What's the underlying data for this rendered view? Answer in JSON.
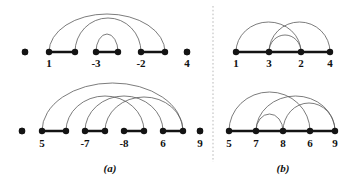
{
  "figure": {
    "type": "arc-diagram-figure",
    "background": "#ffffff",
    "node_color": "#141414",
    "segment_color": "#141414",
    "arc_color": "#5a5a5a",
    "divider_color": "#b9b9b9",
    "panels": [
      {
        "id": "a",
        "caption": "(a)",
        "caption_x": 110,
        "caption_y": 172,
        "rows": [
          {
            "id": "a-top",
            "baseline_y": 52,
            "nodes": [
              {
                "label": "",
                "x": 25,
                "show_label": false
              },
              {
                "label": "1",
                "x": 49,
                "show_label": true,
                "label_x": 49
              },
              {
                "label": "",
                "x": 75,
                "show_label": false
              },
              {
                "label": "-3",
                "x": 96,
                "show_label": true,
                "label_x": 96
              },
              {
                "label": "",
                "x": 118,
                "show_label": false
              },
              {
                "label": "-2",
                "x": 141,
                "show_label": true,
                "label_x": 141
              },
              {
                "label": "",
                "x": 165,
                "show_label": false
              },
              {
                "label": "4",
                "x": 187,
                "show_label": true,
                "label_x": 187
              }
            ],
            "label_y": 67,
            "segments": [
              {
                "x1": 49,
                "x2": 75
              },
              {
                "x1": 96,
                "x2": 118
              },
              {
                "x1": 141,
                "x2": 165
              }
            ],
            "arcs": [
              {
                "x1": 49,
                "x2": 165,
                "height": 38
              },
              {
                "x1": 75,
                "x2": 141,
                "height": 34
              },
              {
                "x1": 96,
                "x2": 118,
                "height": 18
              }
            ],
            "isolated": [
              {
                "x": 25
              },
              {
                "x": 187
              }
            ]
          },
          {
            "id": "a-bottom",
            "baseline_y": 131,
            "nodes": [
              {
                "label": "",
                "x": 22,
                "show_label": false
              },
              {
                "label": "5",
                "x": 42,
                "show_label": true,
                "label_x": 42
              },
              {
                "label": "",
                "x": 66,
                "show_label": false
              },
              {
                "label": "-7",
                "x": 85,
                "show_label": true,
                "label_x": 85
              },
              {
                "label": "",
                "x": 105,
                "show_label": false
              },
              {
                "label": "-8",
                "x": 124,
                "show_label": true,
                "label_x": 124
              },
              {
                "label": "",
                "x": 144,
                "show_label": false
              },
              {
                "label": "6",
                "x": 163,
                "show_label": true,
                "label_x": 163
              },
              {
                "label": "",
                "x": 183,
                "show_label": false
              },
              {
                "label": "9",
                "x": 200,
                "show_label": true,
                "label_x": 200
              }
            ],
            "label_y": 147,
            "segments": [
              {
                "x1": 42,
                "x2": 66
              },
              {
                "x1": 85,
                "x2": 105
              },
              {
                "x1": 124,
                "x2": 144
              },
              {
                "x1": 163,
                "x2": 183
              }
            ],
            "arcs": [
              {
                "x1": 42,
                "x2": 183,
                "height": 48
              },
              {
                "x1": 66,
                "x2": 144,
                "height": 35
              },
              {
                "x1": 85,
                "x2": 163,
                "height": 35
              },
              {
                "x1": 105,
                "x2": 183,
                "height": 34
              }
            ],
            "isolated": [
              {
                "x": 22
              },
              {
                "x": 200
              }
            ]
          }
        ]
      },
      {
        "id": "b",
        "caption": "(b)",
        "caption_x": 283,
        "caption_y": 172,
        "rows": [
          {
            "id": "b-top",
            "baseline_y": 52,
            "nodes": [
              {
                "label": "1",
                "x": 236,
                "show_label": true,
                "label_x": 236
              },
              {
                "label": "3",
                "x": 269,
                "show_label": true,
                "label_x": 269
              },
              {
                "label": "2",
                "x": 301,
                "show_label": true,
                "label_x": 301
              },
              {
                "label": "4",
                "x": 330,
                "show_label": true,
                "label_x": 330
              }
            ],
            "label_y": 67,
            "segments": [
              {
                "x1": 236,
                "x2": 330
              }
            ],
            "arcs": [
              {
                "x1": 236,
                "x2": 301,
                "height": 30
              },
              {
                "x1": 269,
                "x2": 330,
                "height": 30
              },
              {
                "x1": 269,
                "x2": 301,
                "height": 17
              }
            ],
            "isolated": []
          },
          {
            "id": "b-bottom",
            "baseline_y": 131,
            "nodes": [
              {
                "label": "5",
                "x": 229,
                "show_label": true,
                "label_x": 229
              },
              {
                "label": "7",
                "x": 256,
                "show_label": true,
                "label_x": 256
              },
              {
                "label": "8",
                "x": 283,
                "show_label": true,
                "label_x": 283
              },
              {
                "label": "6",
                "x": 310,
                "show_label": true,
                "label_x": 310
              },
              {
                "label": "9",
                "x": 335,
                "show_label": true,
                "label_x": 335
              }
            ],
            "label_y": 147,
            "segments": [
              {
                "x1": 229,
                "x2": 335
              }
            ],
            "arcs": [
              {
                "x1": 229,
                "x2": 310,
                "height": 39
              },
              {
                "x1": 256,
                "x2": 335,
                "height": 35
              },
              {
                "x1": 283,
                "x2": 335,
                "height": 28
              },
              {
                "x1": 256,
                "x2": 283,
                "height": 17
              }
            ],
            "isolated": []
          }
        ]
      }
    ],
    "divider": {
      "x": 213,
      "y1": 6,
      "y2": 162
    },
    "geometry": {
      "dot_radius": 3.2,
      "width": 350,
      "height": 190
    }
  }
}
